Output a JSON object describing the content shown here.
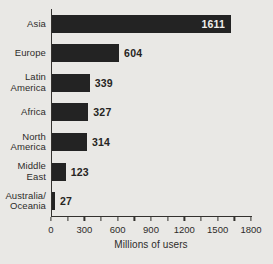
{
  "window": {
    "background_color": "#e9e8e5"
  },
  "chart_data": {
    "type": "bar",
    "orientation": "horizontal",
    "title": "",
    "xlabel": "Millions of users",
    "xlim": [
      0,
      1800
    ],
    "xticks": [
      0,
      300,
      600,
      900,
      1200,
      1500,
      1800
    ],
    "minor_tick_step": 150,
    "categories": [
      "Asia",
      "Europe",
      "Latin America",
      "Africa",
      "North America",
      "Middle East",
      "Australia/Oceania"
    ],
    "category_lines": [
      [
        "Asia"
      ],
      [
        "Europe"
      ],
      [
        "Latin",
        "America"
      ],
      [
        "Africa"
      ],
      [
        "North",
        "America"
      ],
      [
        "Middle",
        "East"
      ],
      [
        "Australia/",
        "Oceania"
      ]
    ],
    "values": [
      1611,
      604,
      339,
      327,
      314,
      123,
      27
    ],
    "value_labels": [
      "1611",
      "604",
      "339",
      "327",
      "314",
      "123",
      "27"
    ],
    "grid": false,
    "legend": "none",
    "bar_color": "#232323",
    "value_label_inside_color": "#f0efec",
    "value_label_outside_color": "#262422",
    "axis_color": "#33312e"
  }
}
